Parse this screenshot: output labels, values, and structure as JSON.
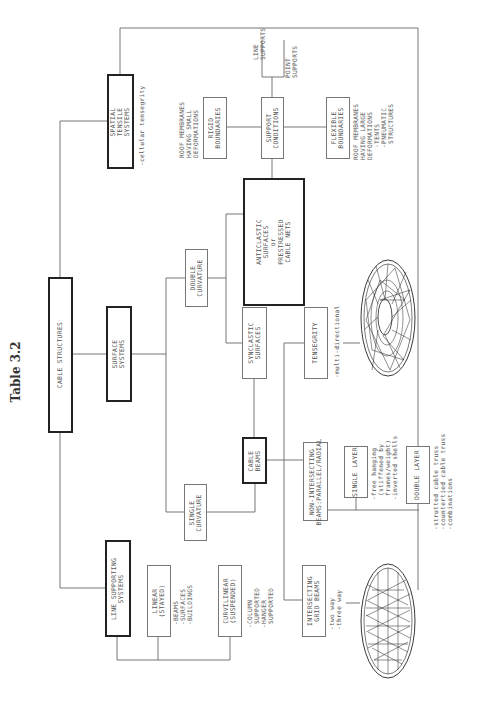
{
  "title": "Table 3.2",
  "root": {
    "label": "CABLE STRUCTURES"
  },
  "level1": {
    "spatial": {
      "label": "SPATIAL\nTENSILE\nSYSTEMS",
      "note": "-cellular tensegrity"
    },
    "surface": {
      "label": "SURFACE\nSYSTEMS"
    },
    "line": {
      "label": "LINE SUPPORTING\nSYSTEMS"
    }
  },
  "surface_branch": {
    "double_curvature": {
      "label": "DOUBLE\nCURVATURE"
    },
    "single_curvature": {
      "label": "SINGLE\nCURVATURE"
    },
    "anticlastic": {
      "label": "ANTICLASTIC\nSURFACES\nor\nPRESTRESSED\nCABLE NETS"
    },
    "synclastic": {
      "label": "SYNCLASTIC\nSURFACES"
    },
    "cable_beams": {
      "label": "CABLE\nBEAMS"
    }
  },
  "support": {
    "conditions": {
      "label": "SUPPORT\nCONDITIONS"
    },
    "line_supports": {
      "label": "LINE\nSUPPORTS"
    },
    "point_supports": {
      "label": "POINT\nSUPPORTS"
    },
    "rigid": {
      "label": "RIGID\nBOUNDARIES",
      "note": "ROOF MEMBRANES\nHAVING SMALL\nDEFORMATIONS"
    },
    "flexible": {
      "label": "FLEXIBLE\nBOUNDARIES",
      "note": "ROOF MEMBRANES\nHAVING LARGE\nDEFORMATIONS\n   -TENTS\n   -PNEUMATIC\n    STRUCTURES"
    }
  },
  "beams": {
    "tensegrity": {
      "label": "TENSEGRITY",
      "note": "-multi-directional"
    },
    "non_intersecting": {
      "label": "NON-INTERSECTING\nBEAMS:PARALLEL/RADIAL"
    },
    "single_layer": {
      "label": "SINGLE LAYER",
      "note": "-free hanging\n (stiffened by\n frames/weight)\n-inverted shells"
    },
    "double_layer": {
      "label": "DOUBLE LAYER",
      "note": "-strutted cable truss\n-countertied cable truss\n-combinations"
    },
    "intersecting": {
      "label": "INTERSECTING\nGRID BEAMS",
      "note": "-two way\n-three way"
    }
  },
  "line_branch": {
    "linear": {
      "label": "LINEAR\n(STAYED)",
      "note": "-BEAMS\n-SURFACES\n-BUILDINGS"
    },
    "curvilinear": {
      "label": "CURVILINEAR\n(SUSPENDED)",
      "note": "-COLUMN\n SUPPORTED\n-HANGER\n SUPPORTED"
    }
  },
  "illustrations": {
    "radial_net": "radial-cable-net-illustration",
    "grid_net": "grid-cable-net-illustration"
  },
  "colors": {
    "line": "#666666",
    "thick_border": "#222222",
    "text": "#555555"
  }
}
